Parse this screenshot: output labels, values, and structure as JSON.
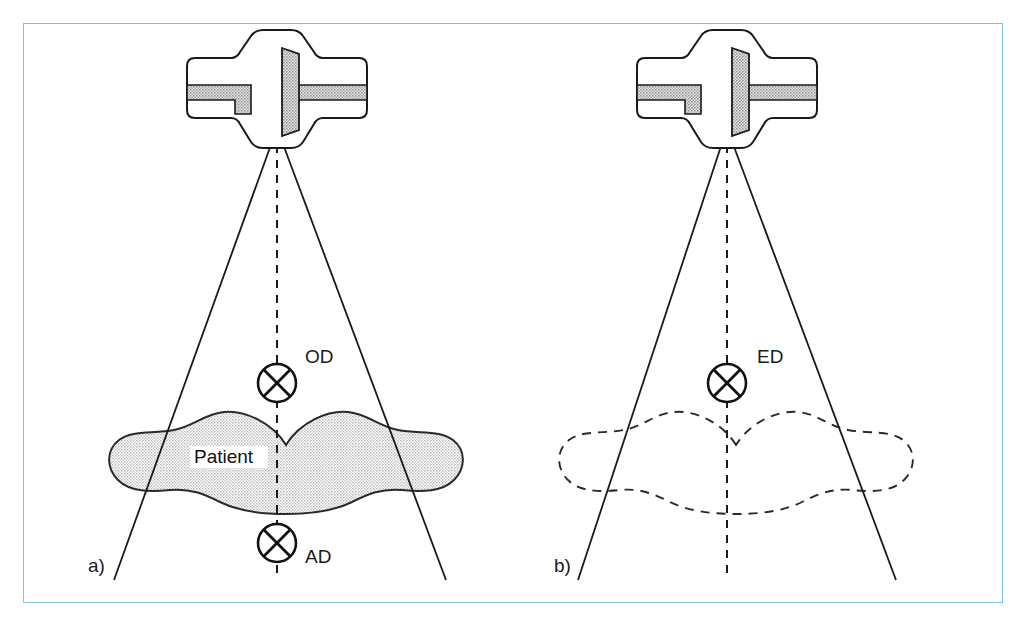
{
  "figure": {
    "frame_color": "#7fc2dc",
    "background_color": "#ffffff",
    "ink_color": "#1a1a1a",
    "patient_fill_color": "#d9d9d9",
    "tube_window_fill_color": "#b5b5b5"
  },
  "panels": [
    {
      "id": "a",
      "label": "a)",
      "label_x": 88,
      "label_y": 572,
      "tube": {
        "name": "x-ray-tube-head",
        "center_x": 277,
        "apex_x": 277,
        "apex_y": 128
      },
      "beam": {
        "apex_x": 277,
        "apex_y": 128,
        "left_end_x": 114,
        "right_end_x": 446,
        "end_y": 580
      },
      "central_axis": {
        "x": 277,
        "top_y": 128,
        "bottom_y": 578,
        "style": "dashed"
      },
      "patient": {
        "present": true,
        "filled": true,
        "outline_style": "solid",
        "label": "Patient",
        "label_x": 196,
        "label_y": 462
      },
      "markers": [
        {
          "name": "entrance-dose-marker",
          "label": "OD",
          "cx": 277,
          "cy": 383,
          "r": 19,
          "label_x": 305,
          "label_y": 363
        },
        {
          "name": "exit-dose-marker",
          "label": "AD",
          "cx": 277,
          "cy": 543,
          "r": 19,
          "label_x": 305,
          "label_y": 563
        }
      ]
    },
    {
      "id": "b",
      "label": "b)",
      "label_x": 554,
      "label_y": 572,
      "tube": {
        "name": "x-ray-tube-head",
        "center_x": 727,
        "apex_x": 727,
        "apex_y": 128
      },
      "beam": {
        "apex_x": 727,
        "apex_y": 128,
        "left_end_x": 578,
        "right_end_x": 896,
        "end_y": 580
      },
      "central_axis": {
        "x": 727,
        "top_y": 128,
        "bottom_y": 578,
        "style": "dashed"
      },
      "patient": {
        "present": true,
        "filled": false,
        "outline_style": "dashed",
        "label": "",
        "label_x": 0,
        "label_y": 0
      },
      "markers": [
        {
          "name": "effective-dose-marker",
          "label": "ED",
          "cx": 727,
          "cy": 383,
          "r": 19,
          "label_x": 757,
          "label_y": 363
        }
      ]
    }
  ],
  "legend_terms": {
    "OD": "OD",
    "AD": "AD",
    "ED": "ED",
    "Patient": "Patient"
  }
}
